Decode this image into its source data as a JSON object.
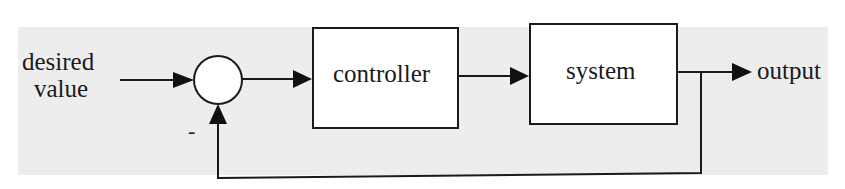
{
  "diagram": {
    "type": "feedback control loop",
    "input": {
      "label_line1": "desired",
      "label_line2": "value"
    },
    "summing_junction": {
      "feedback_sign": "-"
    },
    "blocks": [
      {
        "id": "controller",
        "label": "controller"
      },
      {
        "id": "system",
        "label": "system"
      }
    ],
    "output": {
      "label": "output"
    },
    "colors": {
      "background": "#ededed",
      "box_fill": "#ffffff",
      "stroke": "#1a1a1a"
    }
  }
}
